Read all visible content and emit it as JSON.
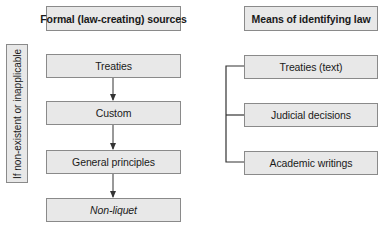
{
  "left_column": {
    "header": "Formal (law-creating) sources",
    "items": [
      {
        "label": "Treaties",
        "italic": false
      },
      {
        "label": "Custom",
        "italic": false
      },
      {
        "label": "General principles",
        "italic": false
      },
      {
        "label": "Non-liquet",
        "italic": true
      }
    ]
  },
  "right_column": {
    "header": "Means of identifying law",
    "items": [
      {
        "label": "Treaties (text)"
      },
      {
        "label": "Judicial decisions"
      },
      {
        "label": "Academic writings"
      }
    ]
  },
  "side_label": "If non-existent or inapplicable",
  "colors": {
    "box_fill": "#e8e8e8",
    "box_border": "#8a8a8a",
    "connector": "#333333"
  }
}
